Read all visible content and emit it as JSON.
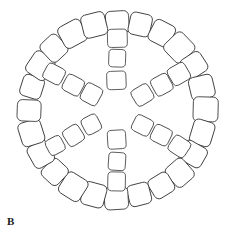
{
  "figure": {
    "panel_label": "B",
    "caption": "",
    "background_color": "#ffffff",
    "stroke_color": "#3c3c3c",
    "fill_color": "#ffffff",
    "canvas": {
      "width": 239,
      "height": 249
    }
  },
  "chart_data": {
    "type": "diagram",
    "title": "",
    "center": {
      "x": 117,
      "y": 110
    },
    "outer_ring": {
      "name": "outer-ring",
      "tile_count": 24,
      "radius": 88,
      "tile_size": 23,
      "corner_radius": 5,
      "start_angle_deg": -90,
      "label": "Outer ring"
    },
    "spokes": [
      {
        "name": "spoke-up",
        "angle_deg": -90,
        "tile_count": 3,
        "tile_size": 18,
        "r_start": 30,
        "r_step": 21
      },
      {
        "name": "spoke-upper-right",
        "angle_deg": -30,
        "tile_count": 3,
        "tile_size": 18,
        "r_start": 30,
        "r_step": 21
      },
      {
        "name": "spoke-lower-right",
        "angle_deg": 30,
        "tile_count": 3,
        "tile_size": 18,
        "r_start": 30,
        "r_step": 21
      },
      {
        "name": "spoke-down",
        "angle_deg": 90,
        "tile_count": 3,
        "tile_size": 18,
        "r_start": 30,
        "r_step": 21
      },
      {
        "name": "spoke-lower-left",
        "angle_deg": 150,
        "tile_count": 3,
        "tile_size": 18,
        "r_start": 30,
        "r_step": 21
      },
      {
        "name": "spoke-upper-left",
        "angle_deg": -150,
        "tile_count": 3,
        "tile_size": 18,
        "r_start": 30,
        "r_step": 21
      }
    ],
    "cropped_figure_below": {
      "name": "next-panel-partial",
      "center": {
        "x": 117,
        "y": 352
      },
      "radius": 88,
      "tile_count": 24,
      "tile_size": 23,
      "visible": true,
      "note": "Top edge of the next panel clipped by the image bottom"
    }
  }
}
